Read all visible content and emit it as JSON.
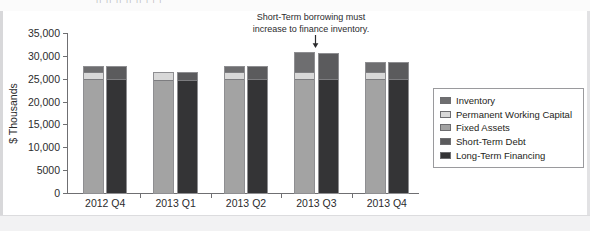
{
  "figure": {
    "cropped_top_text": "|| ||      ||          || ||      |       |    |",
    "ylabel": "$ Thousands",
    "annotation_line1": "Short-Term borrowing must",
    "annotation_line2": "increase to finance inventory.",
    "arrow_icon": "down-arrow-icon"
  },
  "colors": {
    "inventory": "#6e6e70",
    "permanent_working_capital": "#a3a3a3",
    "fixed_assets": "#d8d8d8",
    "short_term_debt": "#5b5b5d",
    "long_term_financing": "#343436",
    "axis": "#6f6f72",
    "text": "#2b2b2d",
    "bar_outline": "#8e8e91"
  },
  "legend": {
    "position": "right",
    "items": [
      {
        "label": "Inventory",
        "color": "#6e6e70"
      },
      {
        "label": "Permanent Working Capital",
        "color": "#d8d8d8"
      },
      {
        "label": "Fixed Assets",
        "color": "#a3a3a3"
      },
      {
        "label": "Short-Term Debt",
        "color": "#5b5b5d"
      },
      {
        "label": "Long-Term Financing",
        "color": "#343436"
      }
    ]
  },
  "chart_data": {
    "type": "bar",
    "subtype": "grouped-stacked",
    "title": "",
    "xlabel": "",
    "ylabel": "$ Thousands",
    "ylim": [
      0,
      35000
    ],
    "yticks": [
      0,
      5000,
      10000,
      15000,
      20000,
      25000,
      30000,
      35000
    ],
    "ytick_labels": [
      "0",
      "5000",
      "10,000",
      "15,000",
      "20,000",
      "25,000",
      "30,000",
      "35,000"
    ],
    "grid": false,
    "legend_position": "right",
    "categories": [
      "2012 Q4",
      "2013 Q1",
      "2013 Q2",
      "2013 Q3",
      "2013 Q4"
    ],
    "annotations": [
      {
        "text": "Short-Term borrowing must increase to finance inventory.",
        "target_category": "2013 Q3",
        "arrow": "down"
      }
    ],
    "stacks": [
      {
        "name": "Assets",
        "position": "left",
        "series": [
          {
            "name": "Permanent Working Capital",
            "color": "#a3a3a3",
            "values": [
              25000,
              25000,
              25000,
              25000,
              25000
            ]
          },
          {
            "name": "Fixed Assets",
            "color": "#d8d8d8",
            "values": [
              1600,
              1800,
              1700,
              1600,
              1600
            ]
          },
          {
            "name": "Inventory",
            "color": "#6e6e70",
            "values": [
              1500,
              0,
              1400,
              4500,
              2200
            ]
          }
        ],
        "totals": [
          28100,
          26800,
          28100,
          31100,
          28800
        ]
      },
      {
        "name": "Financing",
        "position": "right",
        "series": [
          {
            "name": "Long-Term Financing",
            "color": "#343436",
            "values": [
              25000,
              25000,
              25000,
              25000,
              25000
            ]
          },
          {
            "name": "Short-Term Debt",
            "color": "#5b5b5d",
            "values": [
              3100,
              1800,
              3100,
              5800,
              3800
            ]
          }
        ],
        "totals": [
          28100,
          26800,
          28100,
          30800,
          28800
        ]
      }
    ]
  }
}
